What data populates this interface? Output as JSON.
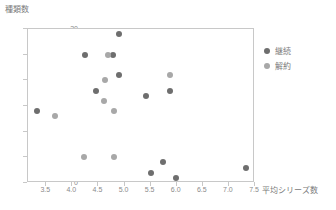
{
  "chart_data": {
    "type": "scatter",
    "title": "",
    "xlabel": "平均シリーズ数",
    "ylabel": "種類数",
    "xlim": [
      3.15,
      7.5
    ],
    "ylim": [
      0,
      30
    ],
    "xticks": [
      "3.5",
      "4.0",
      "4.5",
      "5.0",
      "5.5",
      "6.0",
      "6.5",
      "7.0",
      "7.5"
    ],
    "xtick_values": [
      3.5,
      4.0,
      4.5,
      5.0,
      5.5,
      6.0,
      6.5,
      7.0,
      7.5
    ],
    "yticks": [
      "0",
      "5",
      "10",
      "15",
      "20",
      "25",
      "30"
    ],
    "ytick_values": [
      0,
      5,
      10,
      15,
      20,
      25,
      30
    ],
    "grid": false,
    "legend_position": "right",
    "series": [
      {
        "name": "継続",
        "color": "#6e6e6e",
        "points": [
          {
            "x": 3.32,
            "y": 14
          },
          {
            "x": 4.25,
            "y": 25
          },
          {
            "x": 4.78,
            "y": 25
          },
          {
            "x": 4.9,
            "y": 29
          },
          {
            "x": 4.9,
            "y": 21
          },
          {
            "x": 4.45,
            "y": 18
          },
          {
            "x": 5.42,
            "y": 17
          },
          {
            "x": 5.88,
            "y": 18
          },
          {
            "x": 5.5,
            "y": 2
          },
          {
            "x": 5.74,
            "y": 4
          },
          {
            "x": 5.98,
            "y": 1
          },
          {
            "x": 7.33,
            "y": 3
          }
        ]
      },
      {
        "name": "解約",
        "color": "#a8a8a8",
        "points": [
          {
            "x": 3.66,
            "y": 13
          },
          {
            "x": 4.68,
            "y": 25
          },
          {
            "x": 4.62,
            "y": 20
          },
          {
            "x": 4.6,
            "y": 16
          },
          {
            "x": 4.8,
            "y": 14
          },
          {
            "x": 5.87,
            "y": 21
          },
          {
            "x": 4.23,
            "y": 5
          },
          {
            "x": 4.8,
            "y": 5
          }
        ]
      }
    ]
  },
  "legend": {
    "items": [
      {
        "label": "継続",
        "color": "#6e6e6e"
      },
      {
        "label": "解約",
        "color": "#a8a8a8"
      }
    ]
  },
  "axes": {
    "y_title": "種類数",
    "x_title": "平均シリーズ数"
  },
  "colors": {
    "frame": "#c8c8c8",
    "text": "#7a7a7a",
    "tick_text": "#8a8a8a",
    "background": "#ffffff"
  }
}
